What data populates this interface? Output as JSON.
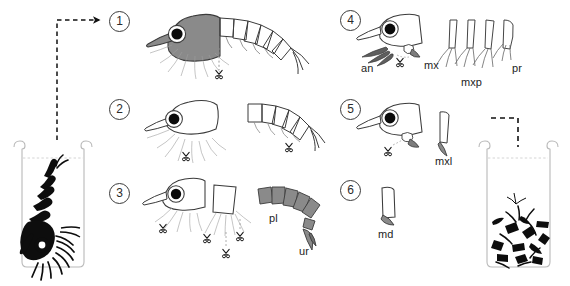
{
  "figure": {
    "background_color": "#ffffff",
    "ink_color": "#1a1a1a",
    "body_fill": "#808080",
    "eye_color": "#000000"
  },
  "steps": [
    {
      "id": "step-1",
      "number": "1"
    },
    {
      "id": "step-2",
      "number": "2"
    },
    {
      "id": "step-3",
      "number": "3"
    },
    {
      "id": "step-4",
      "number": "4"
    },
    {
      "id": "step-5",
      "number": "5"
    },
    {
      "id": "step-6",
      "number": "6"
    }
  ],
  "labels": {
    "an": "an",
    "mx": "mx",
    "mxp": "mxp",
    "pr": "pr",
    "mxl": "mxl",
    "md": "md",
    "pl": "pl",
    "ur": "ur"
  },
  "vessels": {
    "source": {
      "name": "source-beaker",
      "contents": "whole krill specimen"
    },
    "target": {
      "name": "collection-beaker",
      "contents": "dissected body parts"
    }
  },
  "icons": {
    "scissors": "scissors-icon",
    "arrow_out": "dashed-arrow-out-icon",
    "arrow_in": "dashed-arrow-in-icon"
  },
  "caption": ""
}
